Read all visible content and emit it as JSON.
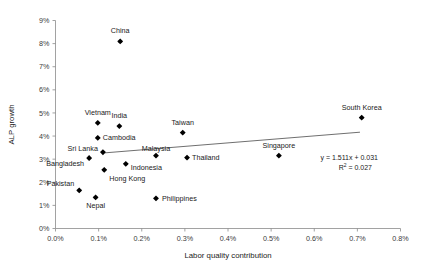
{
  "chart_data": {
    "type": "scatter",
    "title": "",
    "xlabel": "Labor quality contribution",
    "ylabel": "ALP growth",
    "xlim": [
      0.0,
      0.8
    ],
    "ylim": [
      0,
      9
    ],
    "grid": false,
    "legend": null,
    "x_tick_labels": [
      "0.0%",
      "0.1%",
      "0.2%",
      "0.3%",
      "0.4%",
      "0.5%",
      "0.6%",
      "0.7%",
      "0.8%"
    ],
    "x_tick_values": [
      0.0,
      0.1,
      0.2,
      0.3,
      0.4,
      0.5,
      0.6,
      0.7,
      0.8
    ],
    "y_tick_labels": [
      "0%",
      "1%",
      "2%",
      "3%",
      "4%",
      "5%",
      "6%",
      "7%",
      "8%",
      "9%"
    ],
    "y_tick_values": [
      0,
      1,
      2,
      3,
      4,
      5,
      6,
      7,
      8,
      9
    ],
    "points": [
      {
        "label": "China",
        "x": 0.15,
        "y": 8.1,
        "label_dx": 0,
        "label_dy": -8,
        "anchor": "middle"
      },
      {
        "label": "Vietnam",
        "x": 0.098,
        "y": 4.57,
        "label_dx": 0,
        "label_dy": -8,
        "anchor": "middle"
      },
      {
        "label": "India",
        "x": 0.148,
        "y": 4.43,
        "label_dx": 0,
        "label_dy": -8,
        "anchor": "middle"
      },
      {
        "label": "Taiwan",
        "x": 0.295,
        "y": 4.15,
        "label_dx": 0,
        "label_dy": -8,
        "anchor": "middle"
      },
      {
        "label": "South Korea",
        "x": 0.71,
        "y": 4.8,
        "label_dx": 0,
        "label_dy": -8,
        "anchor": "middle"
      },
      {
        "label": "Cambodia",
        "x": 0.098,
        "y": 3.92,
        "label_dx": 5,
        "label_dy": 2.5,
        "anchor": "start"
      },
      {
        "label": "Sri Lanka",
        "x": 0.11,
        "y": 3.3,
        "label_dx": -5,
        "label_dy": -1,
        "anchor": "end"
      },
      {
        "label": "Malaysia",
        "x": 0.233,
        "y": 3.15,
        "label_dx": 0,
        "label_dy": -5,
        "anchor": "middle"
      },
      {
        "label": "Singapore",
        "x": 0.518,
        "y": 3.15,
        "label_dx": 0,
        "label_dy": -8,
        "anchor": "middle"
      },
      {
        "label": "Thailand",
        "x": 0.305,
        "y": 3.07,
        "label_dx": 5,
        "label_dy": 2.5,
        "anchor": "start"
      },
      {
        "label": "Bangladesh",
        "x": 0.078,
        "y": 3.05,
        "label_dx": -5,
        "label_dy": 8,
        "anchor": "end"
      },
      {
        "label": "Indonesia",
        "x": 0.163,
        "y": 2.8,
        "label_dx": 5,
        "label_dy": 6,
        "anchor": "start"
      },
      {
        "label": "Hong Kong",
        "x": 0.113,
        "y": 2.54,
        "label_dx": 5,
        "label_dy": 11,
        "anchor": "start"
      },
      {
        "label": "Pakistan",
        "x": 0.055,
        "y": 1.65,
        "label_dx": -5,
        "label_dy": -4,
        "anchor": "end"
      },
      {
        "label": "Nepal",
        "x": 0.093,
        "y": 1.35,
        "label_dx": 0,
        "label_dy": 11,
        "anchor": "middle"
      },
      {
        "label": "Philippines",
        "x": 0.233,
        "y": 1.3,
        "label_dx": 6,
        "label_dy": 2.5,
        "anchor": "start"
      }
    ],
    "trendline": {
      "slope": 1.511,
      "intercept": 0.031,
      "r_squared": 0.027,
      "equation_text": "y = 1.511x + 0.031",
      "r2_text_prefix": "R",
      "r2_text_sup": "2",
      "r2_text_rest": " = 0.027",
      "x_start": 0.11,
      "x_end": 0.706
    }
  }
}
